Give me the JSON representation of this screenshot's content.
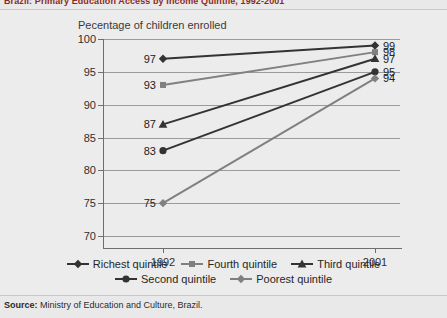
{
  "title": "Brazil: Primary Education Access by Income Quintile, 1992-2001",
  "source_label": "Source:",
  "source_text": "Ministry of Education and Culture, Brazil.",
  "colors": {
    "title": "#8c2b22",
    "background": "#e9e9e9",
    "plot_background": "#ececec",
    "dark_series": "#333333",
    "gray_series": "#808080",
    "gridline": "#9b9b9b",
    "axis": "#6e6e6e",
    "text": "#2b2b2b"
  },
  "chart_data": {
    "type": "line",
    "title": "Brazil: Primary Education Access by Income Quintile, 1992-2001",
    "xlabel": "",
    "ylabel": "Pecentage of children enrolled",
    "x": [
      "1992",
      "2001"
    ],
    "categories": [
      "1992",
      "2001"
    ],
    "ylim": [
      70,
      100
    ],
    "yticks": [
      70,
      75,
      80,
      85,
      90,
      95,
      100
    ],
    "ytick_labels": [
      "70",
      "75",
      "80",
      "85",
      "90",
      "95",
      "100"
    ],
    "grid": true,
    "grid_axis": "y",
    "legend_position": "bottom",
    "series": [
      {
        "name": "Richest quintile",
        "values": [
          97,
          99
        ],
        "labels": [
          "97",
          "99"
        ],
        "marker": "diamond",
        "color": "#333333"
      },
      {
        "name": "Fourth quintile",
        "values": [
          93,
          98
        ],
        "labels": [
          "93",
          "98"
        ],
        "marker": "square",
        "color": "#808080"
      },
      {
        "name": "Third quintile",
        "values": [
          87,
          97
        ],
        "labels": [
          "87",
          "97"
        ],
        "marker": "triangle",
        "color": "#333333"
      },
      {
        "name": "Second quintile",
        "values": [
          83,
          95
        ],
        "labels": [
          "83",
          "95"
        ],
        "marker": "circle",
        "color": "#333333"
      },
      {
        "name": "Poorest quintile",
        "values": [
          75,
          94
        ],
        "labels": [
          "75",
          "94"
        ],
        "marker": "diamond",
        "color": "#808080"
      }
    ]
  },
  "legend": {
    "row1": [
      {
        "label": "Richest quintile",
        "marker": "diamond",
        "color": "#333333"
      },
      {
        "label": "Fourth quintile",
        "marker": "square",
        "color": "#808080"
      },
      {
        "label": "Third quintile",
        "marker": "triangle",
        "color": "#333333"
      }
    ],
    "row2": [
      {
        "label": "Second quintile",
        "marker": "circle",
        "color": "#333333"
      },
      {
        "label": "Poorest quintile",
        "marker": "diamond",
        "color": "#808080"
      }
    ]
  }
}
